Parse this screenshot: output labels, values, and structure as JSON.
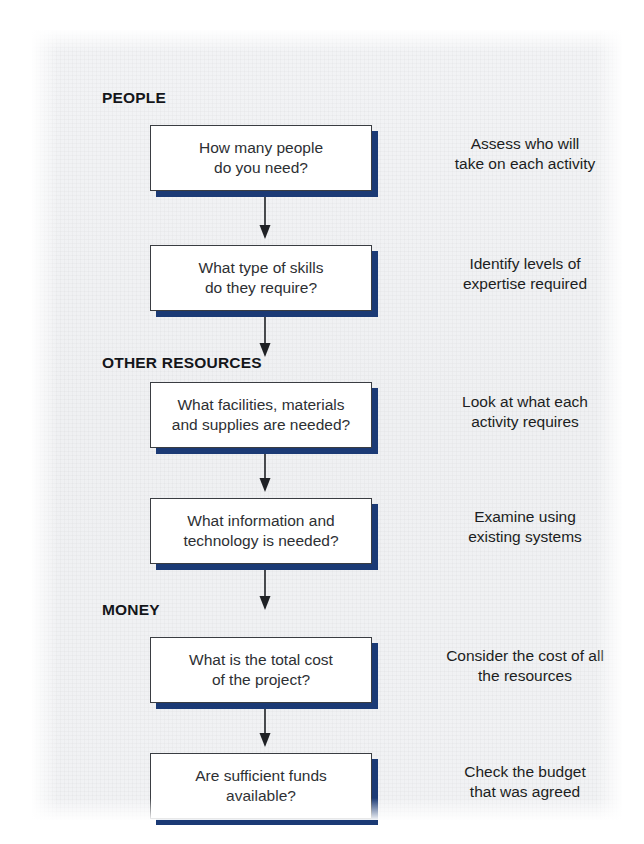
{
  "diagram": {
    "colors": {
      "box_fill": "#ffffff",
      "box_border": "#3a3d42",
      "box_shadow": "#1b3a75",
      "heading_text": "#14161a",
      "body_text": "#2d2f33",
      "panel_background": "#f1f2f4"
    },
    "sections": [
      {
        "id": "people",
        "heading": "PEOPLE",
        "steps": [
          {
            "id": "people-count",
            "box_text": "How many people\ndo you need?",
            "annotation": "Assess who will\ntake on each activity"
          },
          {
            "id": "people-skills",
            "box_text": "What type of skills\ndo they require?",
            "annotation": "Identify levels of\nexpertise required"
          }
        ]
      },
      {
        "id": "other-resources",
        "heading": "OTHER RESOURCES",
        "steps": [
          {
            "id": "facilities",
            "box_text": "What facilities, materials\nand supplies are needed?",
            "annotation": "Look at what each\nactivity requires"
          },
          {
            "id": "information-technology",
            "box_text": "What information and\ntechnology is needed?",
            "annotation": "Examine using\nexisting systems"
          }
        ]
      },
      {
        "id": "money",
        "heading": "MONEY",
        "steps": [
          {
            "id": "total-cost",
            "box_text": "What is the total cost\nof the project?",
            "annotation": "Consider the cost of all\nthe resources"
          },
          {
            "id": "sufficient-funds",
            "box_text": "Are sufficient funds\navailable?",
            "annotation": "Check the budget\nthat was agreed"
          }
        ]
      }
    ],
    "connectors": [
      {
        "id": "arrow-1",
        "from": "people-count",
        "to": "people-skills"
      },
      {
        "id": "arrow-2",
        "from": "people-skills",
        "to": "facilities"
      },
      {
        "id": "arrow-3",
        "from": "facilities",
        "to": "information-technology"
      },
      {
        "id": "arrow-4",
        "from": "information-technology",
        "to": "total-cost"
      },
      {
        "id": "arrow-5",
        "from": "total-cost",
        "to": "sufficient-funds"
      }
    ]
  }
}
